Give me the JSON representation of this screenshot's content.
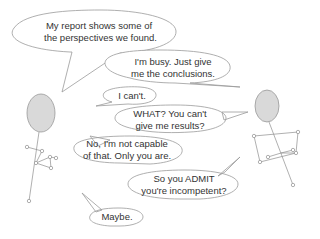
{
  "comic": {
    "colors": {
      "stroke": "#9a9a9a",
      "head_fill": "#d9d9d9",
      "text": "#333333",
      "background": "#ffffff"
    },
    "characters": [
      {
        "name": "left-figure"
      },
      {
        "name": "right-figure"
      }
    ],
    "dialogue": [
      {
        "speaker": "left",
        "line1": "My report shows some of",
        "line2": "the perspectives we found."
      },
      {
        "speaker": "right",
        "line1": "I'm busy. Just give",
        "line2": "me the conclusions."
      },
      {
        "speaker": "left",
        "line1": "I can't.",
        "line2": ""
      },
      {
        "speaker": "right",
        "line1": "WHAT? You can't",
        "line2": "give me results?"
      },
      {
        "speaker": "left",
        "line1": "No, I'm not capable",
        "line2": "of that. Only you are."
      },
      {
        "speaker": "right",
        "line1": "So you ADMIT",
        "line2": "you're incompetent?"
      },
      {
        "speaker": "left",
        "line1": "Maybe.",
        "line2": ""
      }
    ]
  }
}
